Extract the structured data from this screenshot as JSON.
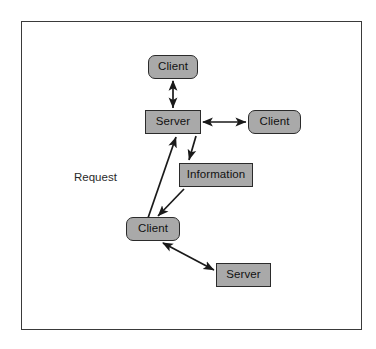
{
  "diagram": {
    "frame": {
      "border_color": "#3a3a3a",
      "background": "#ffffff"
    },
    "style": {
      "node_fill": "#a9a9a9",
      "node_border": "#2b2b2b",
      "edge_color": "#1a1a1a",
      "text_color": "#111111"
    },
    "nodes": [
      {
        "id": "client-top",
        "label": "Client",
        "shape": "rounded-rect",
        "x": 148,
        "y": 55,
        "w": 50,
        "h": 24
      },
      {
        "id": "server-main",
        "label": "Server",
        "shape": "rect",
        "x": 145,
        "y": 110,
        "w": 56,
        "h": 24
      },
      {
        "id": "client-right",
        "label": "Client",
        "shape": "rounded-rect",
        "x": 248,
        "y": 110,
        "w": 53,
        "h": 24
      },
      {
        "id": "information",
        "label": "Information",
        "shape": "rect",
        "x": 179,
        "y": 163,
        "w": 74,
        "h": 24
      },
      {
        "id": "client-bottom",
        "label": "Client",
        "shape": "rounded-rect",
        "x": 126,
        "y": 217,
        "w": 54,
        "h": 24
      },
      {
        "id": "server-bottom",
        "label": "Server",
        "shape": "rect",
        "x": 216,
        "y": 263,
        "w": 55,
        "h": 24
      }
    ],
    "labels": [
      {
        "id": "request-label",
        "text": "Request",
        "x": 74,
        "y": 171
      }
    ],
    "edges": [
      {
        "id": "edge-client-top-server",
        "from": "client-top",
        "to": "server-main",
        "arrows": "both"
      },
      {
        "id": "edge-server-client-right",
        "from": "server-main",
        "to": "client-right",
        "arrows": "both"
      },
      {
        "id": "edge-client-bottom-server",
        "from": "client-bottom",
        "to": "server-main",
        "arrows": "end"
      },
      {
        "id": "edge-server-information",
        "from": "server-main",
        "to": "information",
        "arrows": "end"
      },
      {
        "id": "edge-information-client-bottom",
        "from": "information",
        "to": "client-bottom",
        "arrows": "end"
      },
      {
        "id": "edge-client-bottom-server-bottom",
        "from": "client-bottom",
        "to": "server-bottom",
        "arrows": "both"
      }
    ]
  }
}
